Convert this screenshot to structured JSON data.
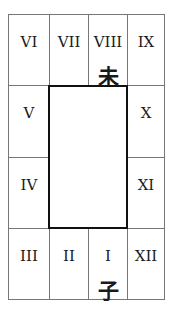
{
  "diagram": {
    "type": "palace-grid",
    "cells": {
      "top": [
        {
          "numeral": "VI",
          "branch": ""
        },
        {
          "numeral": "VII",
          "branch": ""
        },
        {
          "numeral": "VIII",
          "branch": "未"
        },
        {
          "numeral": "IX",
          "branch": ""
        }
      ],
      "left": [
        {
          "numeral": "V",
          "branch": ""
        },
        {
          "numeral": "IV",
          "branch": ""
        }
      ],
      "right": [
        {
          "numeral": "X",
          "branch": ""
        },
        {
          "numeral": "XI",
          "branch": ""
        }
      ],
      "bottom": [
        {
          "numeral": "III",
          "branch": ""
        },
        {
          "numeral": "II",
          "branch": ""
        },
        {
          "numeral": "I",
          "branch": "子"
        },
        {
          "numeral": "XII",
          "branch": ""
        }
      ]
    },
    "center": {
      "label": ""
    }
  }
}
